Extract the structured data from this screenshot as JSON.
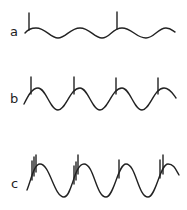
{
  "figure": {
    "panels": [
      {
        "label": "a",
        "description": "low-amplitude sine wave with two single spikes",
        "spike_groups": [
          {
            "x": 29,
            "count": 1
          },
          {
            "x": 117,
            "count": 1
          }
        ]
      },
      {
        "label": "b",
        "description": "medium-amplitude sine wave with one spike per cycle near each peak",
        "spike_groups": [
          {
            "x": 31,
            "count": 1
          },
          {
            "x": 74,
            "count": 1
          },
          {
            "x": 116,
            "count": 1
          },
          {
            "x": 158,
            "count": 1
          }
        ]
      },
      {
        "label": "c",
        "description": "large-amplitude sine wave with bursts of spikes on rising phase",
        "spike_groups": [
          {
            "x": 33,
            "count": 3
          },
          {
            "x": 76,
            "count": 3
          },
          {
            "x": 119,
            "count": 1
          },
          {
            "x": 161,
            "count": 2
          }
        ]
      }
    ],
    "stroke_color": "#222222",
    "background": "#ffffff"
  }
}
